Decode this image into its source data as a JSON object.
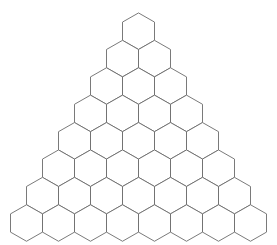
{
  "figure": {
    "kind": "honeycomb-triangle",
    "background_color": "#ffffff",
    "stroke_color": "#6b6b6b",
    "fill_color": "#ffffff",
    "stroke_width": 0.9,
    "canvas": {
      "width": 277,
      "height": 245
    }
  },
  "grid": {
    "rows": 8,
    "total_hexagons": 36,
    "row_counts": [
      1,
      2,
      3,
      4,
      5,
      6,
      7,
      8
    ],
    "orientation": "pointy-top",
    "hex_width": 32.0,
    "hex_height": 36.5,
    "row_step_y": 27.4,
    "apex_center": {
      "x": 138.5,
      "y": 31.2
    },
    "bounds": {
      "left": 11.0,
      "right": 266.0,
      "top": 13.0,
      "bottom": 232.0
    }
  },
  "labels": {
    "caption": ""
  }
}
